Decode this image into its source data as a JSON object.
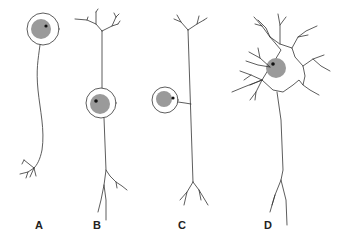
{
  "figure": {
    "labels": [
      "A",
      "B",
      "C",
      "D"
    ],
    "colors": {
      "stroke": "#333333",
      "nucleus": "#9a9a9a",
      "nucleolus": "#111111",
      "background": "#ffffff"
    }
  }
}
